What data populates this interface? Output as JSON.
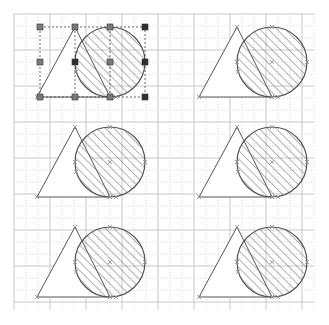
{
  "canvas": {
    "width": 329,
    "height": 325,
    "background": "#ffffff",
    "grid": {
      "x0": 14,
      "y0": 14,
      "x1": 314,
      "y1": 310,
      "spacing": 12,
      "major_color": "#c8c8c8",
      "minor_color": "#d6d6d6"
    }
  },
  "shape_style": {
    "stroke": "#555555",
    "hatch_color": "#666666",
    "vertex_mark_color": "#8a8a8a"
  },
  "figures": [
    {
      "id": "figure-1",
      "dx": 0,
      "dy": 0,
      "selected": true
    },
    {
      "id": "figure-2",
      "dx": 162,
      "dy": 0,
      "selected": false
    },
    {
      "id": "figure-3",
      "dx": 0,
      "dy": 100,
      "selected": false
    },
    {
      "id": "figure-4",
      "dx": 162,
      "dy": 100,
      "selected": false
    },
    {
      "id": "figure-5",
      "dx": 0,
      "dy": 200,
      "selected": false
    },
    {
      "id": "figure-6",
      "dx": 162,
      "dy": 200,
      "selected": false
    }
  ],
  "template_shape": {
    "triangle": [
      [
        37,
        97
      ],
      [
        75,
        27
      ],
      [
        110,
        97
      ]
    ],
    "circle": {
      "cx": 110,
      "cy": 62,
      "r": 35
    }
  },
  "selection": {
    "bbox": {
      "x": 40,
      "y": 27,
      "w": 105,
      "h": 70
    },
    "handle_color": "#7a7a7a",
    "handle_dark_color": "#2e2e2e",
    "handles": [
      {
        "x": 40,
        "y": 27,
        "dark": false
      },
      {
        "x": 75,
        "y": 27,
        "dark": false
      },
      {
        "x": 110,
        "y": 27,
        "dark": false
      },
      {
        "x": 145,
        "y": 27,
        "dark": true
      },
      {
        "x": 40,
        "y": 62,
        "dark": false
      },
      {
        "x": 75,
        "y": 62,
        "dark": true
      },
      {
        "x": 110,
        "y": 62,
        "dark": false
      },
      {
        "x": 145,
        "y": 62,
        "dark": true
      },
      {
        "x": 40,
        "y": 97,
        "dark": false
      },
      {
        "x": 75,
        "y": 97,
        "dark": false
      },
      {
        "x": 110,
        "y": 97,
        "dark": false
      },
      {
        "x": 145,
        "y": 97,
        "dark": true
      }
    ]
  }
}
